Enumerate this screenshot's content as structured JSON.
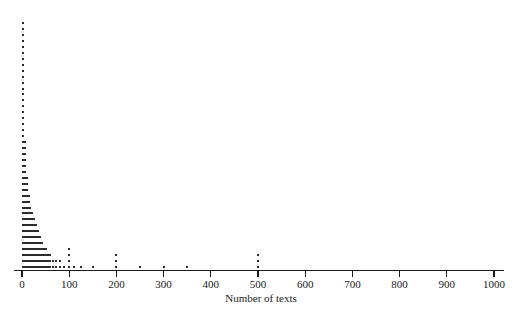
{
  "chart_data": {
    "type": "scatter",
    "plot_style": "stacked-dot-plot",
    "title": "",
    "xlabel": "Number of texts",
    "ylabel": "",
    "xlim": [
      0,
      1000
    ],
    "ylim": [
      0,
      44
    ],
    "grid": false,
    "legend": null,
    "xticks": [
      0,
      100,
      200,
      300,
      400,
      500,
      600,
      700,
      800,
      900,
      1000
    ],
    "xtick_labels": [
      "0",
      "100",
      "200",
      "300",
      "400",
      "500",
      "600",
      "700",
      "800",
      "900",
      "1000"
    ],
    "dot_color": "#2b2b2b",
    "axis_color": "#1a1a1a",
    "background_color": "#ffffff",
    "x": [
      2,
      6,
      10,
      14,
      18,
      22,
      26,
      30,
      34,
      38,
      42,
      46,
      50,
      55,
      60,
      65,
      72,
      80,
      88,
      100,
      110,
      125,
      150,
      200,
      250,
      300,
      350,
      500
    ],
    "counts": [
      42,
      22,
      16,
      13,
      11,
      10,
      9,
      8,
      7,
      6,
      5,
      4,
      4,
      3,
      3,
      2,
      2,
      2,
      1,
      4,
      1,
      1,
      1,
      3,
      1,
      1,
      1,
      3
    ],
    "series": [
      {
        "name": "texts",
        "points": [
          {
            "x": 2,
            "count": 42
          },
          {
            "x": 6,
            "count": 22
          },
          {
            "x": 10,
            "count": 16
          },
          {
            "x": 14,
            "count": 13
          },
          {
            "x": 18,
            "count": 11
          },
          {
            "x": 22,
            "count": 10
          },
          {
            "x": 26,
            "count": 9
          },
          {
            "x": 30,
            "count": 8
          },
          {
            "x": 34,
            "count": 7
          },
          {
            "x": 38,
            "count": 6
          },
          {
            "x": 42,
            "count": 5
          },
          {
            "x": 46,
            "count": 4
          },
          {
            "x": 50,
            "count": 4
          },
          {
            "x": 55,
            "count": 3
          },
          {
            "x": 60,
            "count": 3
          },
          {
            "x": 65,
            "count": 2
          },
          {
            "x": 72,
            "count": 2
          },
          {
            "x": 80,
            "count": 2
          },
          {
            "x": 88,
            "count": 1
          },
          {
            "x": 100,
            "count": 4
          },
          {
            "x": 110,
            "count": 1
          },
          {
            "x": 125,
            "count": 1
          },
          {
            "x": 150,
            "count": 1
          },
          {
            "x": 200,
            "count": 3
          },
          {
            "x": 250,
            "count": 1
          },
          {
            "x": 300,
            "count": 1
          },
          {
            "x": 350,
            "count": 1
          },
          {
            "x": 500,
            "count": 3
          }
        ]
      }
    ]
  },
  "axis": {
    "title": "Number of texts"
  }
}
